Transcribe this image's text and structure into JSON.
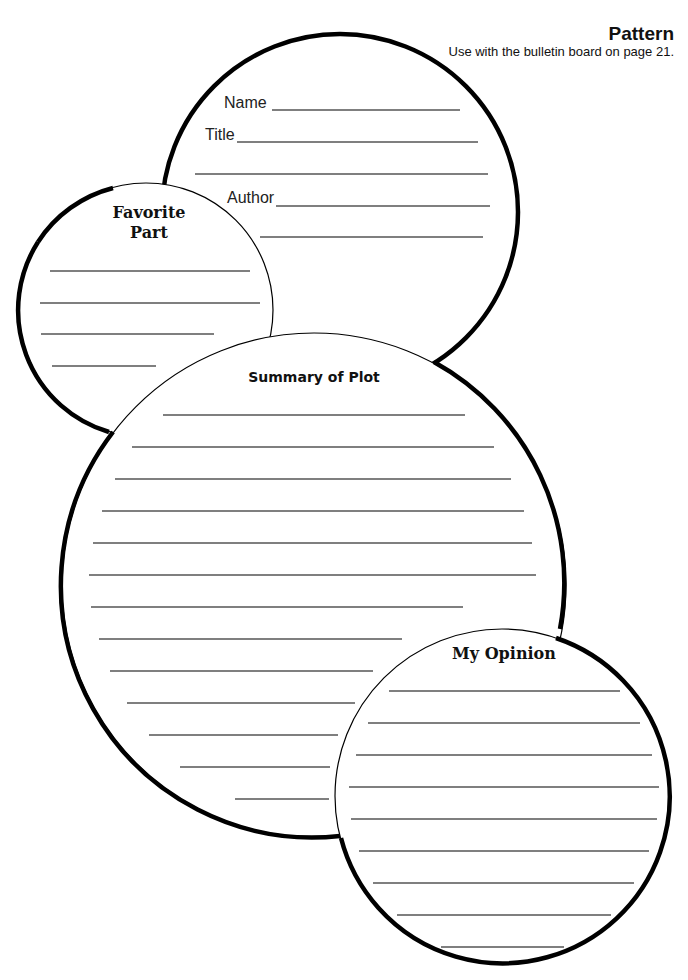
{
  "header": {
    "title": "Pattern",
    "subtitle": "Use with the bulletin board on page 21."
  },
  "circles": {
    "book_info": {
      "fields": [
        {
          "label": "Name",
          "x": 224,
          "y": 108
        },
        {
          "label": "Title",
          "x": 205,
          "y": 140
        },
        {
          "label": "Author",
          "x": 227,
          "y": 203
        }
      ],
      "lines": [
        [
          272,
          110,
          460,
          110
        ],
        [
          237,
          142,
          478,
          142
        ],
        [
          195,
          174,
          488,
          174
        ],
        [
          276,
          206,
          490,
          206
        ],
        [
          260,
          237,
          483,
          237
        ]
      ]
    },
    "favorite_part": {
      "heading_line1": "Favorite",
      "heading_line2": "Part",
      "lines": [
        [
          50,
          271,
          250,
          271
        ],
        [
          40,
          303,
          260,
          303
        ],
        [
          41,
          334,
          214,
          334
        ],
        [
          52,
          366,
          156,
          366
        ]
      ]
    },
    "summary": {
      "heading": "Summary of Plot",
      "lines": [
        [
          163,
          415,
          465,
          415
        ],
        [
          132,
          447,
          494,
          447
        ],
        [
          115,
          479,
          511,
          479
        ],
        [
          102,
          511,
          524,
          511
        ],
        [
          93,
          543,
          532,
          543
        ],
        [
          89,
          575,
          536,
          575
        ],
        [
          91,
          607,
          463,
          607
        ],
        [
          99,
          639,
          402,
          639
        ],
        [
          110,
          671,
          373,
          671
        ],
        [
          127,
          703,
          355,
          703
        ],
        [
          149,
          735,
          338,
          735
        ],
        [
          180,
          767,
          330,
          767
        ],
        [
          235,
          799,
          329,
          799
        ]
      ]
    },
    "opinion": {
      "heading": "My Opinion",
      "lines": [
        [
          389,
          691,
          620,
          691
        ],
        [
          368,
          723,
          640,
          723
        ],
        [
          356,
          755,
          652,
          755
        ],
        [
          349,
          787,
          659,
          787
        ],
        [
          351,
          819,
          657,
          819
        ],
        [
          359,
          851,
          649,
          851
        ],
        [
          373,
          883,
          634,
          883
        ],
        [
          397,
          915,
          611,
          915
        ],
        [
          441,
          947,
          564,
          947
        ]
      ]
    }
  }
}
